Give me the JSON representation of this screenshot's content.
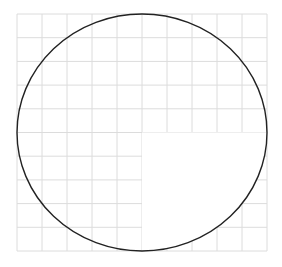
{
  "diagram": {
    "grid": {
      "columns": 10,
      "rows": 10,
      "line_color": "#dcdcdc"
    },
    "circle": {
      "stroke_color": "#222222"
    },
    "blank_quadrant": "bottom-right",
    "background_color": "#ffffff"
  }
}
